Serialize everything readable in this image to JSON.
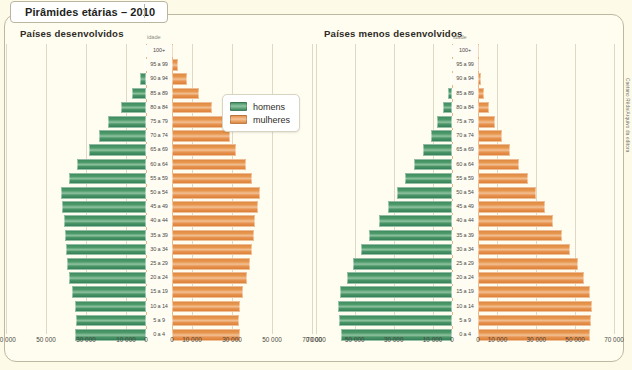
{
  "title": "Pirâmides etárias – 2010",
  "credit": "Caetano Rêda/Arquivo da editora",
  "legend": {
    "male_label": "homens",
    "female_label": "mulheres",
    "male_color": "#4b9468",
    "female_color": "#e79450"
  },
  "axis": {
    "idade_label": "idade",
    "tick_labels_left": [
      "70 000",
      "50 000",
      "30 000",
      "10 000",
      "0"
    ],
    "tick_labels_right": [
      "0",
      "10 000",
      "30 000",
      "50 000",
      "70 000"
    ]
  },
  "age_groups": [
    "100+",
    "95 a 99",
    "90 a 94",
    "85 a 89",
    "80 a 84",
    "75 a 79",
    "70 a 74",
    "65 a 69",
    "60 a 64",
    "55 a 59",
    "50 a 54",
    "45 a 49",
    "40 a 44",
    "35 a 39",
    "30 a 34",
    "25 a 29",
    "20 a 24",
    "15 a 19",
    "10 a 14",
    "5 a 9",
    "0 a 4"
  ],
  "chart_data": [
    {
      "type": "bar",
      "title": "Países desenvolvidos",
      "subtype": "population-pyramid",
      "xlabel": "",
      "ylabel": "idade",
      "xlim": [
        0,
        70000
      ],
      "xticks": [
        0,
        10000,
        30000,
        50000,
        70000
      ],
      "grid": true,
      "legend_position": "top-right",
      "categories": [
        "100+",
        "95 a 99",
        "90 a 94",
        "85 a 89",
        "80 a 84",
        "75 a 79",
        "70 a 74",
        "65 a 69",
        "60 a 64",
        "55 a 59",
        "50 a 54",
        "45 a 49",
        "40 a 44",
        "35 a 39",
        "30 a 34",
        "25 a 29",
        "20 a 24",
        "15 a 19",
        "10 a 14",
        "5 a 9",
        "0 a 4"
      ],
      "series": [
        {
          "name": "homens",
          "color": "#4b9468",
          "values": [
            300,
            1200,
            3200,
            7000,
            12500,
            19000,
            23500,
            28500,
            34500,
            38500,
            42500,
            42000,
            41000,
            40500,
            40000,
            39500,
            38500,
            37000,
            35500,
            35000,
            35500
          ]
        },
        {
          "name": "mulheres",
          "color": "#e79450",
          "values": [
            900,
            3200,
            7500,
            13500,
            20000,
            26000,
            29000,
            32000,
            37000,
            40000,
            44000,
            43000,
            41500,
            41000,
            40000,
            39000,
            37500,
            35500,
            34000,
            33500,
            34000
          ]
        }
      ]
    },
    {
      "type": "bar",
      "title": "Países menos desenvolvidos",
      "subtype": "population-pyramid",
      "xlabel": "",
      "ylabel": "idade",
      "xlim": [
        0,
        70000
      ],
      "xticks": [
        0,
        10000,
        30000,
        50000,
        70000
      ],
      "grid": true,
      "legend_position": "top-right",
      "categories": [
        "100+",
        "95 a 99",
        "90 a 94",
        "85 a 89",
        "80 a 84",
        "75 a 79",
        "70 a 74",
        "65 a 69",
        "60 a 64",
        "55 a 59",
        "50 a 54",
        "45 a 49",
        "40 a 44",
        "35 a 39",
        "30 a 34",
        "25 a 29",
        "20 a 24",
        "15 a 19",
        "10 a 14",
        "5 a 9",
        "0 a 4"
      ],
      "series": [
        {
          "name": "homens",
          "color": "#4b9468",
          "values": [
            60,
            300,
            900,
            2200,
            4400,
            7500,
            11000,
            15000,
            19500,
            24000,
            28500,
            33000,
            37500,
            42500,
            47000,
            51000,
            54000,
            57500,
            58500,
            58000,
            57000
          ]
        },
        {
          "name": "mulheres",
          "color": "#e79450",
          "values": [
            120,
            500,
            1400,
            3200,
            5800,
            9000,
            12500,
            16500,
            21000,
            25500,
            30000,
            34500,
            38500,
            43000,
            47500,
            51500,
            54500,
            57500,
            58500,
            58000,
            57500
          ]
        }
      ]
    }
  ]
}
